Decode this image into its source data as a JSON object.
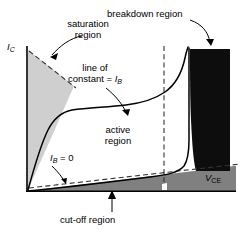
{
  "figure": {
    "type": "diagram",
    "axes": {
      "y_label_main": "I",
      "y_label_sub": "C",
      "x_label_main": "V",
      "x_label_sub": "CE",
      "origin": [
        26,
        192
      ],
      "x_end": 236,
      "y_top": 46
    },
    "regions": [
      {
        "name": "saturation region",
        "label_line1": "saturation",
        "label_line2": "region",
        "fill": "#cfcfcf",
        "boundary": "dashed"
      },
      {
        "name": "active region",
        "label_line1": "active",
        "label_line2": "region",
        "fill": "#ffffff",
        "boundary": "solid"
      },
      {
        "name": "breakdown region",
        "label_line1": "breakdown region",
        "label_line2": "",
        "fill": "#0d0d0d",
        "boundary": "solid"
      },
      {
        "name": "cut-off region",
        "label_line1": "cut-off region",
        "label_line2": "",
        "fill": "#808080",
        "boundary": "dashed"
      }
    ],
    "annotations": [
      {
        "name": "line-of-constant-ib",
        "line1": "line of",
        "line2_prefix": "constant = ",
        "line2_symbol": "I",
        "line2_sub": "B"
      },
      {
        "name": "ib-zero",
        "symbol": "I",
        "sub": "B",
        "equals": " = 0"
      }
    ],
    "colors": {
      "saturation_fill": "#cfcfcf",
      "cutoff_fill": "#808080",
      "breakdown_fill": "#0d0d0d",
      "plot_bg": "#ffffff",
      "stroke": "#000000"
    }
  }
}
